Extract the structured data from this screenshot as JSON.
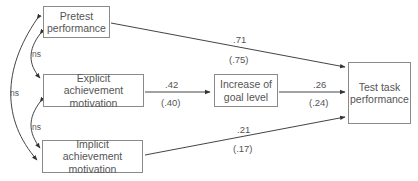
{
  "diagram": {
    "nodes": [
      {
        "id": "pretest",
        "line1": "Pretest",
        "line2": "performance"
      },
      {
        "id": "explicit",
        "line1": "Explicit",
        "line2": "achievement motivation"
      },
      {
        "id": "implicit",
        "line1": "Implicit",
        "line2": "achievement motivation"
      },
      {
        "id": "goal",
        "line1": "Increase of",
        "line2": "goal level"
      },
      {
        "id": "test",
        "line1": "Test task",
        "line2": "performance"
      }
    ],
    "paths": [
      {
        "from": "pretest",
        "to": "test",
        "coef": ".71",
        "coef_alt": "(.75)"
      },
      {
        "from": "explicit",
        "to": "goal",
        "coef": ".42",
        "coef_alt": "(.40)"
      },
      {
        "from": "goal",
        "to": "test",
        "coef": ".26",
        "coef_alt": "(.24)"
      },
      {
        "from": "implicit",
        "to": "test",
        "coef": ".21",
        "coef_alt": "(.17)"
      }
    ],
    "correlations": [
      {
        "between": [
          "pretest",
          "explicit"
        ],
        "label": "ns"
      },
      {
        "between": [
          "explicit",
          "implicit"
        ],
        "label": "ns"
      },
      {
        "between": [
          "pretest",
          "implicit"
        ],
        "label": "ns"
      }
    ]
  }
}
